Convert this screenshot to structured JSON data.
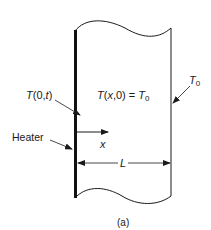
{
  "diagram": {
    "caption": "(a)",
    "labels": {
      "boundary_temp": {
        "T": "T",
        "args": "(0,",
        "t": "t",
        "close": ")"
      },
      "initial_condition": {
        "T": "T",
        "args": "(",
        "x": "x",
        "rest": ",0) = ",
        "T0": "T",
        "sub": "0"
      },
      "far_temp": {
        "T": "T",
        "sub": "0"
      },
      "heater": "Heater",
      "x_axis": "x",
      "length": "L"
    },
    "colors": {
      "stroke": "#1a1a1a",
      "background": "#ffffff"
    }
  }
}
